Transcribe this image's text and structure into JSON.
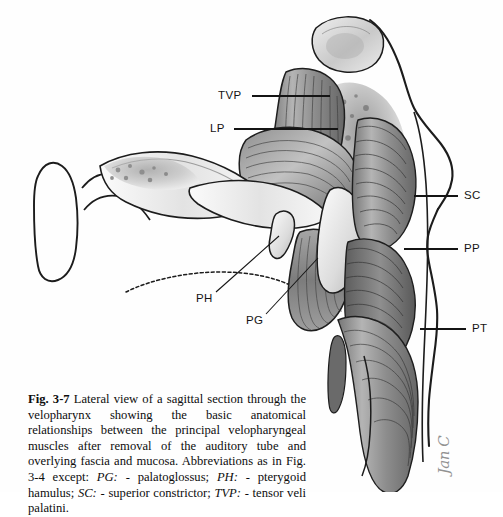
{
  "page": {
    "background_color": "#fefefe",
    "width": 503,
    "height": 492
  },
  "figure": {
    "name": "velopharynx-lateral-sagittal-illustration",
    "style": "grayscale pen-and-ink anatomical drawing",
    "ink_color": "#1a1a1a",
    "muscle_fill": "#9a9a9a",
    "bone_fill": "#d8d8d8",
    "labels": [
      {
        "id": "tvp",
        "text": "TVP",
        "x": 218,
        "y": 90,
        "leader": {
          "x1": 252,
          "y1": 96,
          "x2": 330,
          "y2": 96
        }
      },
      {
        "id": "lp",
        "text": "LP",
        "x": 210,
        "y": 123,
        "leader": {
          "x1": 234,
          "y1": 129,
          "x2": 338,
          "y2": 129
        }
      },
      {
        "id": "sc",
        "text": "SC",
        "x": 464,
        "y": 190,
        "leader": {
          "x1": 414,
          "y1": 196,
          "x2": 458,
          "y2": 196
        }
      },
      {
        "id": "pp",
        "text": "PP",
        "x": 464,
        "y": 243,
        "leader": {
          "x1": 404,
          "y1": 249,
          "x2": 458,
          "y2": 249
        }
      },
      {
        "id": "pt",
        "text": "PT",
        "x": 472,
        "y": 323,
        "leader": {
          "x1": 420,
          "y1": 329,
          "x2": 466,
          "y2": 329
        }
      },
      {
        "id": "ph",
        "text": "PH",
        "x": 196,
        "y": 293,
        "leader": {
          "x1": 216,
          "y1": 292,
          "x2": 279,
          "y2": 236
        }
      },
      {
        "id": "pg",
        "text": "PG",
        "x": 246,
        "y": 315,
        "leader": {
          "x1": 266,
          "y1": 314,
          "x2": 318,
          "y2": 258
        }
      }
    ],
    "signature": "Jan C"
  },
  "caption": {
    "figure_number": "Fig. 3-7",
    "body_part_1": "  Lateral view of a sagittal section through the velopharynx showing the basic anatomical relationships between the principal velopharyngeal muscles after removal of the auditory tube and overlying fascia and mucosa. Abbreviations as in Fig. 3-4 except: ",
    "abbr_pg": "PG:",
    "abbr_pg_def": " - palatoglossus; ",
    "abbr_ph": "PH:",
    "abbr_ph_def": " - pterygoid hamulus; ",
    "abbr_sc": "SC:",
    "abbr_sc_def": " - superior constrictor; ",
    "abbr_tvp": "TVP:",
    "abbr_tvp_def": " - tensor veli palatini."
  }
}
